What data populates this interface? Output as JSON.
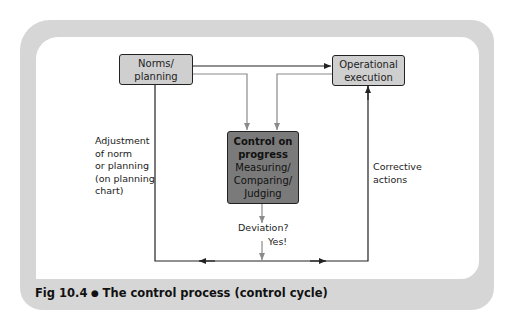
{
  "figure": {
    "number": "Fig 10.4",
    "bullet": "●",
    "title": "The control process (control cycle)"
  },
  "nodes": {
    "norms": {
      "line1": "Norms/",
      "line2": "planning"
    },
    "operational": {
      "line1": "Operational",
      "line2": "execution"
    },
    "control": {
      "line1": "Control on",
      "line2": "progress",
      "line3": "Measuring/",
      "line4": "Comparing/",
      "line5": "Judging"
    }
  },
  "edge_labels": {
    "adjustment": [
      "Adjustment",
      "of norm",
      "or planning",
      "(on planning",
      "chart)"
    ],
    "corrective": [
      "Corrective",
      "actions"
    ],
    "deviation": "Deviation?",
    "yes": "Yes!"
  },
  "colors": {
    "frame": "#d6d6d6",
    "light_box": "#cfcfcf",
    "dark_box": "#7a7a7a",
    "black_line": "#222222",
    "gray_line": "#8a8a8a"
  }
}
